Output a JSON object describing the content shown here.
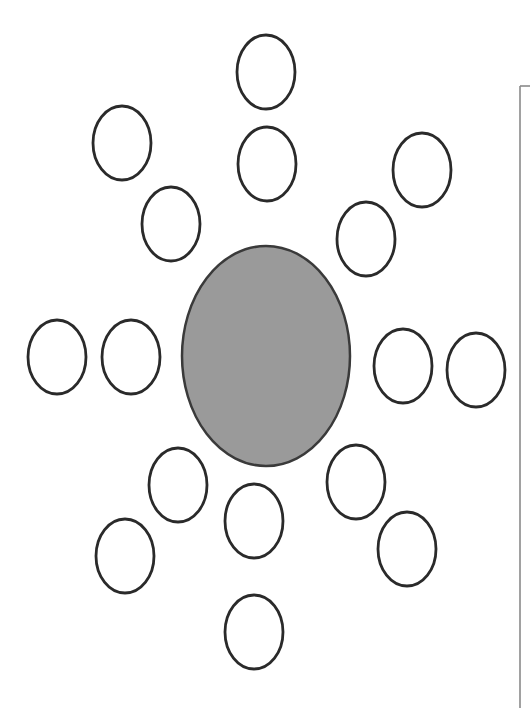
{
  "diagram": {
    "type": "radial-arrangement",
    "center": {
      "shape": "ellipse",
      "cx": 266,
      "cy": 356,
      "rx": 84,
      "ry": 110,
      "fill": "#9a9a9a",
      "stroke": "#3a3a3a"
    },
    "satellite_style": {
      "rx": 29,
      "ry": 37,
      "fill": "#ffffff",
      "stroke": "#2a2a2a",
      "glyph": "feather-arrow-pair",
      "glyph_direction": "toward-center"
    },
    "satellites": [
      {
        "id": "top-outer",
        "cx": 266,
        "cy": 72,
        "angle": 90
      },
      {
        "id": "top-inner",
        "cx": 267,
        "cy": 164,
        "angle": 90
      },
      {
        "id": "top-right-outer",
        "cx": 422,
        "cy": 170,
        "angle": 50
      },
      {
        "id": "top-right-inner",
        "cx": 366,
        "cy": 239,
        "angle": 50
      },
      {
        "id": "right-inner",
        "cx": 403,
        "cy": 366,
        "angle": 0
      },
      {
        "id": "right-outer",
        "cx": 476,
        "cy": 370,
        "angle": 0
      },
      {
        "id": "bottom-right-inner",
        "cx": 356,
        "cy": 482,
        "angle": -55
      },
      {
        "id": "bottom-right-outer",
        "cx": 407,
        "cy": 549,
        "angle": -55
      },
      {
        "id": "bottom-inner",
        "cx": 254,
        "cy": 521,
        "angle": -90
      },
      {
        "id": "bottom-outer",
        "cx": 254,
        "cy": 632,
        "angle": -90
      },
      {
        "id": "bottom-left-inner",
        "cx": 178,
        "cy": 485,
        "angle": -125
      },
      {
        "id": "bottom-left-outer",
        "cx": 125,
        "cy": 556,
        "angle": -125
      },
      {
        "id": "left-outer",
        "cx": 57,
        "cy": 357,
        "angle": 180
      },
      {
        "id": "left-inner",
        "cx": 131,
        "cy": 357,
        "angle": 180
      },
      {
        "id": "top-left-outer",
        "cx": 122,
        "cy": 143,
        "angle": 130
      },
      {
        "id": "top-left-inner",
        "cx": 171,
        "cy": 224,
        "angle": 130
      }
    ],
    "frame": {
      "x": 520,
      "y_top": 86,
      "y_bottom": 708,
      "stroke": "#8a8a8a"
    }
  }
}
